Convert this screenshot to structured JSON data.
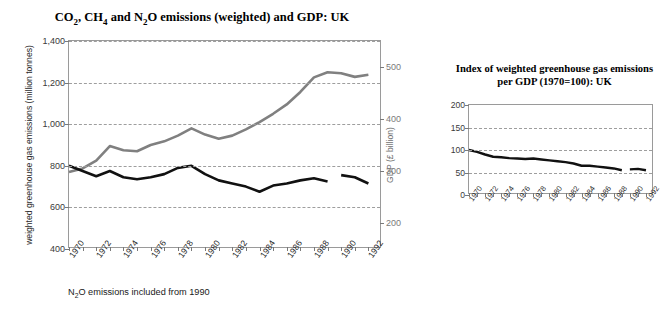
{
  "main_chart": {
    "title": "CO2, CH4 and N2O emissions (weighted) and GDP: UK",
    "ylabel_left": "weighted greenhouse gas emissions (million tonnes)",
    "ylabel_right": "GDP (£ billion)",
    "footnote": "N2O emissions included from 1990"
  },
  "side_chart": {
    "title": "Index of weighted greenhouse gas emissions per GDP (1970=100): UK"
  },
  "colors": {
    "emissions_line": "#111111",
    "gdp_line": "#808080",
    "gridline": "#9e9e9e",
    "frame": "#9a9a9a",
    "right_axis_text": "#7a7a7a"
  },
  "chart_data": [
    {
      "type": "line",
      "title": "CO2, CH4 and N2O emissions (weighted) and GDP: UK",
      "xlabel": "",
      "ylabel": "weighted greenhouse gas emissions (million tonnes)",
      "ylabel_secondary": "GDP (£ billion)",
      "xlim": [
        1970,
        1993
      ],
      "ylim": [
        400,
        1400
      ],
      "ylim_secondary": [
        150,
        550
      ],
      "yticks": [
        400,
        600,
        800,
        1000,
        1200,
        1400
      ],
      "ytick_labels": [
        "400",
        "600",
        "800",
        "1,000",
        "1,200",
        "1,400"
      ],
      "yticks_secondary": [
        200,
        300,
        400,
        500
      ],
      "ytick_labels_secondary": [
        "200",
        "300",
        "400",
        "500"
      ],
      "x": [
        1970,
        1971,
        1972,
        1973,
        1974,
        1975,
        1976,
        1977,
        1978,
        1979,
        1980,
        1981,
        1982,
        1983,
        1984,
        1985,
        1986,
        1987,
        1988,
        1989,
        1990,
        1991,
        1992
      ],
      "xtick_labels": [
        "1970",
        "1972",
        "1974",
        "1976",
        "1978",
        "1980",
        "1982",
        "1984",
        "1986",
        "1988",
        "1990",
        "1992"
      ],
      "grid": true,
      "legend": "none",
      "annotation": "N2O emissions included from 1990",
      "series": [
        {
          "name": "weighted greenhouse gas emissions (million tonnes)",
          "axis": "left",
          "color": "#111111",
          "break_after": 1989,
          "values": [
            800,
            775,
            750,
            775,
            745,
            735,
            745,
            760,
            790,
            800,
            760,
            730,
            715,
            700,
            675,
            705,
            715,
            730,
            740,
            725,
            755,
            745,
            715
          ]
        },
        {
          "name": "GDP (£ billion)",
          "axis": "right",
          "color": "#808080",
          "values": [
            298,
            305,
            320,
            348,
            340,
            338,
            350,
            357,
            368,
            382,
            370,
            362,
            368,
            380,
            394,
            410,
            428,
            452,
            480,
            490,
            488,
            481,
            485
          ]
        }
      ]
    },
    {
      "type": "line",
      "title": "Index of weighted greenhouse gas emissions per GDP (1970=100): UK",
      "xlabel": "",
      "ylabel": "",
      "xlim": [
        1970,
        1993
      ],
      "ylim": [
        0,
        200
      ],
      "yticks": [
        0,
        50,
        100,
        150,
        200
      ],
      "ytick_labels": [
        "0",
        "50",
        "100",
        "150",
        "200"
      ],
      "x": [
        1970,
        1971,
        1972,
        1973,
        1974,
        1975,
        1976,
        1977,
        1978,
        1979,
        1980,
        1981,
        1982,
        1983,
        1984,
        1985,
        1986,
        1987,
        1988,
        1989,
        1990,
        1991,
        1992
      ],
      "xtick_labels": [
        "1970",
        "1972",
        "1974",
        "1976",
        "1978",
        "1980",
        "1982",
        "1984",
        "1986",
        "1988",
        "1990",
        "1992"
      ],
      "grid": true,
      "legend": "none",
      "series": [
        {
          "name": "Index of weighted greenhouse gas emissions per GDP (1970=100)",
          "color": "#111111",
          "break_after": 1989,
          "values": [
            100,
            96,
            90,
            85,
            84,
            82,
            81,
            80,
            81,
            79,
            77,
            75,
            73,
            70,
            65,
            65,
            63,
            61,
            59,
            55,
            57,
            58,
            55
          ]
        }
      ]
    }
  ]
}
